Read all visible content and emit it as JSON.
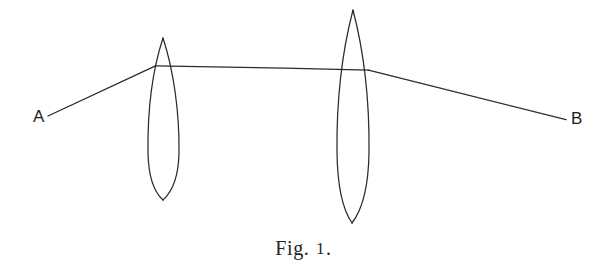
{
  "figure": {
    "domain": "Diagram",
    "kind": "optical-ray-diagram",
    "background_color": "#ffffff",
    "ink_color": "#2b2b2b",
    "width": 607,
    "height": 268,
    "caption": {
      "word": "Fig.",
      "number": "1",
      "terminator": ".",
      "full_text": "Fig. 1."
    },
    "labels": {
      "left_point": "A",
      "right_point": "B"
    },
    "elements": {
      "lens_left_name": "converging-lens-left",
      "lens_right_name": "converging-lens-right",
      "ray_incident_name": "incident-ray-from-A",
      "ray_middle_name": "parallel-ray-between-lenses",
      "ray_exit_name": "exit-ray-to-B"
    },
    "geometry": {
      "lens_left": {
        "center_x": 163,
        "top_y": 38,
        "bottom_y": 200,
        "half_width": 16
      },
      "lens_right": {
        "center_x": 353,
        "top_y": 10,
        "bottom_y": 223,
        "half_width": 16
      },
      "ray_incident": {
        "x1": 48,
        "y1": 116,
        "x2": 155,
        "y2": 66
      },
      "ray_middle": {
        "x1": 155,
        "y1": 66,
        "x2": 368,
        "y2": 70
      },
      "ray_exit": {
        "x1": 368,
        "y1": 70,
        "x2": 566,
        "y2": 120
      }
    }
  }
}
